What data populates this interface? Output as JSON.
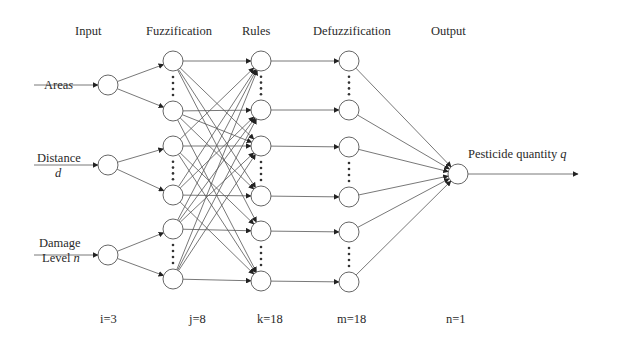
{
  "diagram": {
    "type": "fuzzy neural network",
    "layers": [
      {
        "name": "Input",
        "count_label": "i=3"
      },
      {
        "name": "Fuzzification",
        "count_label": "j=8"
      },
      {
        "name": "Rules",
        "count_label": "k=18"
      },
      {
        "name": "Defuzzification",
        "count_label": "m=18"
      },
      {
        "name": "Output",
        "count_label": "n=1"
      }
    ],
    "inputs": [
      {
        "label": "Area",
        "symbol": "s"
      },
      {
        "label": "Distance",
        "symbol": "d"
      },
      {
        "label": "Damage Level",
        "label_line1": "Damage",
        "label_line2": "Level",
        "symbol": "n"
      }
    ],
    "output": {
      "label": "Pesticide quantity",
      "symbol": "q"
    },
    "colors": {
      "line": "#555555",
      "node_stroke": "#666666",
      "arrow": "#222222",
      "background": "#ffffff"
    }
  }
}
